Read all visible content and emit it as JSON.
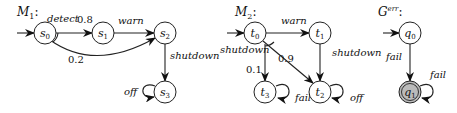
{
  "diagram": {
    "M1": {
      "title": "M",
      "title_sub": "1",
      "states": [
        {
          "id": "s0",
          "base": "s",
          "sub": "0"
        },
        {
          "id": "s1",
          "base": "s",
          "sub": "1"
        },
        {
          "id": "s2",
          "base": "s",
          "sub": "2"
        },
        {
          "id": "s3",
          "base": "s",
          "sub": "3"
        }
      ],
      "edges": [
        {
          "from": "s0",
          "to": "s1",
          "label": "detect",
          "prob": "0.8"
        },
        {
          "from": "s0",
          "to": "s2",
          "label": "detect",
          "prob": "0.2"
        },
        {
          "from": "s1",
          "to": "s2",
          "label": "warn"
        },
        {
          "from": "s2",
          "to": "s3",
          "label": "shutdown"
        },
        {
          "from": "s3",
          "to": "s3",
          "label": "off"
        }
      ]
    },
    "M2": {
      "title": "M",
      "title_sub": "2",
      "states": [
        {
          "id": "t0",
          "base": "t",
          "sub": "0"
        },
        {
          "id": "t1",
          "base": "t",
          "sub": "1"
        },
        {
          "id": "t2",
          "base": "t",
          "sub": "2"
        },
        {
          "id": "t3",
          "base": "t",
          "sub": "3"
        }
      ],
      "edges": [
        {
          "from": "t0",
          "to": "t1",
          "label": "warn"
        },
        {
          "from": "t0",
          "to": "t3",
          "label": "shutdown",
          "prob": "0.1"
        },
        {
          "from": "t0",
          "to": "t2",
          "label": "shutdown",
          "prob": "0.9"
        },
        {
          "from": "t1",
          "to": "t2",
          "label": "shutdown"
        },
        {
          "from": "t3",
          "to": "t3",
          "label": "fail"
        },
        {
          "from": "t2",
          "to": "t2",
          "label": "off"
        }
      ]
    },
    "Gerr": {
      "title": "G",
      "title_sup": "err",
      "states": [
        {
          "id": "q0",
          "base": "q",
          "sub": "0"
        },
        {
          "id": "q1",
          "base": "q",
          "sub": "1",
          "accepting": true
        }
      ],
      "edges": [
        {
          "from": "q0",
          "to": "q1",
          "label": "fail"
        },
        {
          "from": "q1",
          "to": "q1",
          "label": "fail"
        }
      ],
      "accepting_fill": "#bbbbbb"
    }
  }
}
